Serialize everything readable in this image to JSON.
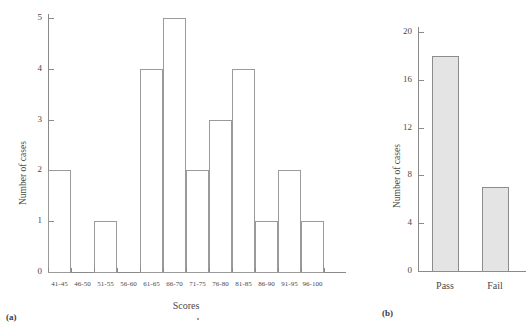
{
  "chart_data": [
    {
      "type": "bar",
      "panel": "(a)",
      "title": "",
      "xlabel": "Scores",
      "ylabel": "Number of cases",
      "categories": [
        "41-45",
        "46-50",
        "51-55",
        "56-60",
        "61-65",
        "66-70",
        "71-75",
        "76-80",
        "81-85",
        "86-90",
        "91-95",
        "96-100"
      ],
      "values": [
        2,
        0,
        1,
        0,
        4,
        5,
        2,
        3,
        4,
        1,
        2,
        1
      ],
      "yticks": [
        "0",
        "1",
        "2",
        "3",
        "4",
        "5"
      ],
      "ytick_values": [
        0,
        1,
        2,
        3,
        4,
        5
      ],
      "ylim": [
        0,
        5
      ],
      "grid": false,
      "legend": "none",
      "bar_style": "outline",
      "bar_fill": "#ffffff",
      "bar_stroke": "#9a9a9a"
    },
    {
      "type": "bar",
      "panel": "(b)",
      "title": "",
      "xlabel": "",
      "ylabel": "Number of cases",
      "categories": [
        "Pass",
        "Fail"
      ],
      "values": [
        18,
        7
      ],
      "yticks": [
        "0",
        "4",
        "8",
        "12",
        "16",
        "20"
      ],
      "ytick_values": [
        0,
        4,
        8,
        12,
        16,
        20
      ],
      "ylim": [
        0,
        20
      ],
      "grid": false,
      "legend": "none",
      "bar_style": "filled",
      "bar_fill": "#e4e4e4",
      "bar_stroke": "#8c8c8c"
    }
  ],
  "panel_a": {
    "caption": "(a)",
    "ylabel": "Number of cases",
    "xlabel": "Scores",
    "yticks": [
      "0",
      "1",
      "2",
      "3",
      "4",
      "5"
    ],
    "xticks": [
      "41-45",
      "46-50",
      "51-55",
      "56-60",
      "61-65",
      "66-70",
      "71-75",
      "76-80",
      "81-85",
      "86-90",
      "91-95",
      "96-100"
    ]
  },
  "panel_b": {
    "caption": "(b)",
    "ylabel": "Number of cases",
    "xlabel": "",
    "yticks": [
      "0",
      "4",
      "8",
      "12",
      "16",
      "20"
    ],
    "xticks": [
      "Pass",
      "Fail"
    ]
  }
}
